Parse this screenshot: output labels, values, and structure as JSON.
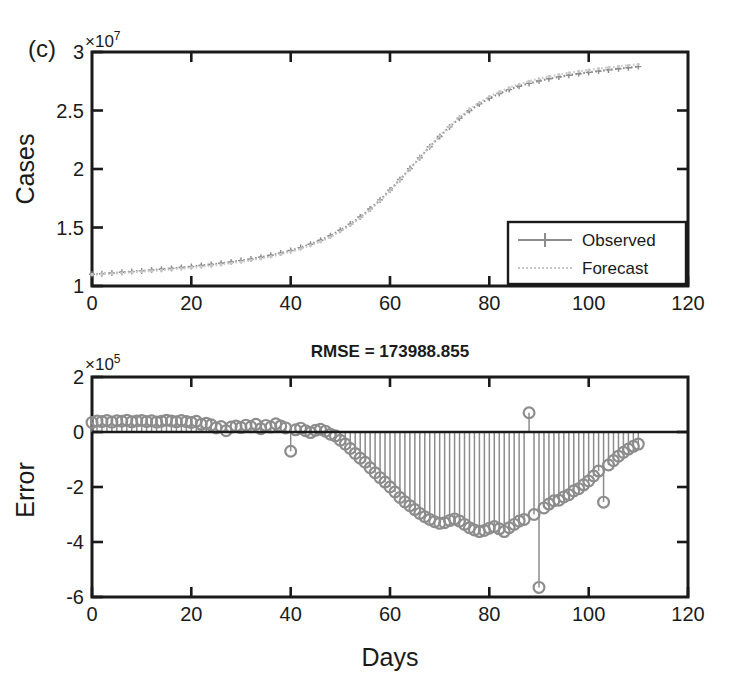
{
  "figure": {
    "panel_label": "(c)",
    "background": "#ffffff",
    "ink_color": "#1a1a1a",
    "data_color": "#8c8c8c",
    "forecast_color": "#c9c9c9"
  },
  "chart_data": [
    {
      "id": "cases-panel",
      "type": "line",
      "title": "",
      "panel_label": "(c)",
      "xlabel": "",
      "ylabel": "Cases",
      "xlim": [
        0,
        120
      ],
      "ylim": [
        10000000,
        30000000
      ],
      "y_exponent_label": "×10",
      "y_exponent_value": "7",
      "x_ticks": [
        0,
        20,
        40,
        60,
        80,
        100,
        120
      ],
      "x_tick_labels": [
        "0",
        "20",
        "40",
        "60",
        "80",
        "100",
        "120"
      ],
      "y_ticks": [
        10000000,
        15000000,
        20000000,
        25000000,
        30000000
      ],
      "y_tick_labels": [
        "1",
        "1.5",
        "2",
        "2.5",
        "3"
      ],
      "grid": false,
      "legend_position": "lower right",
      "legend": [
        "Observed",
        "Forecast"
      ],
      "x": [
        0,
        2,
        4,
        6,
        8,
        10,
        12,
        14,
        16,
        18,
        20,
        22,
        24,
        26,
        28,
        30,
        32,
        34,
        36,
        38,
        40,
        42,
        44,
        46,
        48,
        50,
        52,
        54,
        56,
        58,
        60,
        62,
        64,
        66,
        68,
        70,
        72,
        74,
        76,
        78,
        80,
        82,
        84,
        86,
        88,
        90,
        92,
        94,
        96,
        98,
        100,
        102,
        104,
        106,
        108,
        110
      ],
      "series": [
        {
          "name": "Observed",
          "marker": "plus",
          "values": [
            11000000,
            11050000,
            11110000,
            11170000,
            11230000,
            11290000,
            11360000,
            11430000,
            11500000,
            11580000,
            11660000,
            11750000,
            11840000,
            11940000,
            12050000,
            12170000,
            12300000,
            12450000,
            12620000,
            12810000,
            13030000,
            13280000,
            13570000,
            13910000,
            14300000,
            14760000,
            15290000,
            15900000,
            16590000,
            17360000,
            18200000,
            19100000,
            20030000,
            20970000,
            21900000,
            22780000,
            23600000,
            24340000,
            24990000,
            25560000,
            26040000,
            26450000,
            26790000,
            27080000,
            27320000,
            27530000,
            27710000,
            27870000,
            28010000,
            28140000,
            28260000,
            28370000,
            28470000,
            28570000,
            28660000,
            28750000
          ]
        },
        {
          "name": "Forecast",
          "marker": "dotted",
          "values": [
            10980000,
            11020000,
            11070000,
            11120000,
            11170000,
            11230000,
            11290000,
            11350000,
            11420000,
            11490000,
            11570000,
            11650000,
            11740000,
            11840000,
            11950000,
            12070000,
            12200000,
            12350000,
            12520000,
            12710000,
            12930000,
            13180000,
            13470000,
            13810000,
            14200000,
            14660000,
            15190000,
            15800000,
            16500000,
            17280000,
            18140000,
            19060000,
            20010000,
            20970000,
            21920000,
            22820000,
            23660000,
            24420000,
            25090000,
            25670000,
            26170000,
            26590000,
            26940000,
            27240000,
            27500000,
            27720000,
            27910000,
            28070000,
            28220000,
            28350000,
            28470000,
            28580000,
            28680000,
            28780000,
            28870000,
            28960000
          ]
        }
      ]
    },
    {
      "id": "error-panel",
      "type": "bar",
      "title": "RMSE = 173988.855",
      "xlabel": "Days",
      "ylabel": "Error",
      "xlim": [
        0,
        120
      ],
      "ylim": [
        -600000,
        200000
      ],
      "y_exponent_label": "×10",
      "y_exponent_value": "5",
      "x_ticks": [
        0,
        20,
        40,
        60,
        80,
        100,
        120
      ],
      "x_tick_labels": [
        "0",
        "20",
        "40",
        "60",
        "80",
        "100",
        "120"
      ],
      "y_ticks": [
        200000,
        0,
        -200000,
        -400000,
        -600000
      ],
      "y_tick_labels": [
        "2",
        "0",
        "-2",
        "-4",
        "-6"
      ],
      "grid": false,
      "marker": "circle-open",
      "stem_baseline": 0,
      "categories": [
        0,
        1,
        2,
        3,
        4,
        5,
        6,
        7,
        8,
        9,
        10,
        11,
        12,
        13,
        14,
        15,
        16,
        17,
        18,
        19,
        20,
        21,
        22,
        23,
        24,
        25,
        26,
        27,
        28,
        29,
        30,
        31,
        32,
        33,
        34,
        35,
        36,
        37,
        38,
        39,
        40,
        41,
        42,
        43,
        44,
        45,
        46,
        47,
        48,
        49,
        50,
        51,
        52,
        53,
        54,
        55,
        56,
        57,
        58,
        59,
        60,
        61,
        62,
        63,
        64,
        65,
        66,
        67,
        68,
        69,
        70,
        71,
        72,
        73,
        74,
        75,
        76,
        77,
        78,
        79,
        80,
        81,
        82,
        83,
        84,
        85,
        86,
        87,
        88,
        89,
        90,
        91,
        92,
        93,
        94,
        95,
        96,
        97,
        98,
        99,
        100,
        101,
        102,
        103,
        104,
        105,
        106,
        107,
        108,
        109,
        110
      ],
      "values": [
        35000,
        40000,
        38000,
        42000,
        36000,
        41000,
        39000,
        43000,
        37000,
        40000,
        42000,
        38000,
        41000,
        36000,
        39000,
        43000,
        40000,
        37000,
        42000,
        38000,
        35000,
        39000,
        28000,
        32000,
        26000,
        15000,
        20000,
        5000,
        18000,
        22000,
        16000,
        25000,
        19000,
        28000,
        12000,
        24000,
        18000,
        30000,
        22000,
        15000,
        -70000,
        8000,
        14000,
        5000,
        -2000,
        6000,
        10000,
        3000,
        -8000,
        -14000,
        -30000,
        -44000,
        -60000,
        -78000,
        -95000,
        -110000,
        -130000,
        -148000,
        -166000,
        -182000,
        -200000,
        -218000,
        -238000,
        -254000,
        -268000,
        -282000,
        -296000,
        -308000,
        -318000,
        -326000,
        -332000,
        -330000,
        -322000,
        -316000,
        -324000,
        -336000,
        -348000,
        -356000,
        -362000,
        -358000,
        -350000,
        -344000,
        -352000,
        -362000,
        -348000,
        -336000,
        -324000,
        -318000,
        70000,
        -300000,
        -565000,
        -276000,
        -262000,
        -250000,
        -248000,
        -236000,
        -228000,
        -214000,
        -206000,
        -192000,
        -178000,
        -160000,
        -142000,
        -255000,
        -120000,
        -104000,
        -88000,
        -74000,
        -62000,
        -52000,
        -44000
      ],
      "outliers": [
        {
          "x": 88,
          "y": 70000
        },
        {
          "x": 90,
          "y": -565000
        },
        {
          "x": 103,
          "y": -255000
        },
        {
          "x": 40,
          "y": -70000
        },
        {
          "x": 27,
          "y": 5000
        }
      ]
    }
  ]
}
